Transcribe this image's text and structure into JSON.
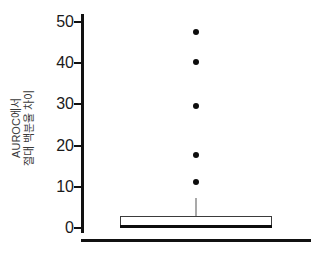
{
  "chart_data": {
    "type": "box",
    "title": "",
    "xlabel": "",
    "ylabel_line1": "AUROC에서",
    "ylabel_line2": "절대 백분율 차이",
    "ylim": [
      0,
      52
    ],
    "yticks": [
      0,
      10,
      20,
      30,
      40,
      50
    ],
    "ytick_labels": [
      "0",
      "10",
      "20",
      "30",
      "40",
      "50"
    ],
    "grid": false,
    "legend": false,
    "categories": [
      "전체"
    ],
    "boxes": [
      {
        "name": "AUROC 절대 백분율 차이",
        "min": 0.0,
        "q1": 0.3,
        "median": 0.35,
        "q3": 3.0,
        "whisker_low": 0.0,
        "whisker_high": 7.3,
        "outliers": [
          11.1,
          17.8,
          29.5,
          40.2,
          47.6
        ]
      }
    ],
    "colors": {
      "box_fill": "#ffffff",
      "box_edge": "#3b3b3b",
      "median": "#0d0d0d",
      "whisker": "#555555",
      "outlier": "#0d0d0d",
      "axis": "#111111",
      "tick_text": "#1a1a1a",
      "label_text": "#3a3a3a"
    }
  }
}
